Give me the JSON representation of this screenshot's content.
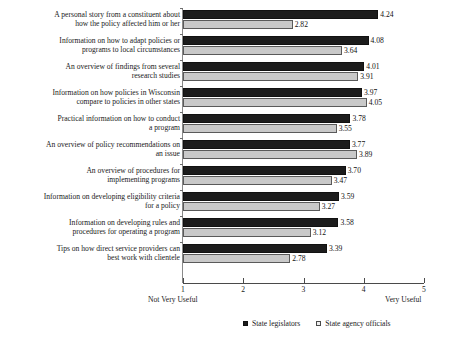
{
  "chart_data": {
    "type": "bar",
    "orientation": "horizontal",
    "grouped": true,
    "title": "",
    "subtitle": "",
    "xlabel": "",
    "ylabel": "",
    "xlim": [
      1,
      5
    ],
    "xticks": [
      "1",
      "2",
      "3",
      "4",
      "5"
    ],
    "grid": false,
    "legend_position": "bottom",
    "scale_anchor_low": "Not Very Useful",
    "scale_anchor_high": "Very Useful",
    "categories": [
      "A personal story from a constituent about\nhow the policy affected him or her",
      "Information on how to adapt policies or\nprograms to local circumstances",
      "An overview of findings from several\nresearch studies",
      "Information on how policies in Wisconsin\ncompare to policies in other states",
      "Practical information on how to conduct\na program",
      "An overview of policy recommendations on\nan issue",
      "An overview of procedures for\nimplementing programs",
      "Information on developing eligibility criteria\nfor a policy",
      "Information on developing rules and\nprocedures for operating a program",
      "Tips on how direct service providers can\nbest work with clientele"
    ],
    "series": [
      {
        "name": "State legislators",
        "color": "#1c1c1c",
        "values": [
          4.24,
          4.08,
          4.01,
          3.97,
          3.78,
          3.77,
          3.7,
          3.59,
          3.58,
          3.39
        ],
        "labels": [
          "4.24",
          "4.08",
          "4.01",
          "3.97",
          "3.78",
          "3.77",
          "3.70",
          "3.59",
          "3.58",
          "3.39"
        ]
      },
      {
        "name": "State agency officials",
        "color": "#c9c9c9",
        "values": [
          2.82,
          3.64,
          3.91,
          4.05,
          3.55,
          3.89,
          3.47,
          3.27,
          3.12,
          2.78
        ],
        "labels": [
          "2.82",
          "3.64",
          "3.91",
          "4.05",
          "3.55",
          "3.89",
          "3.47",
          "3.27",
          "3.12",
          "2.78"
        ]
      }
    ]
  }
}
